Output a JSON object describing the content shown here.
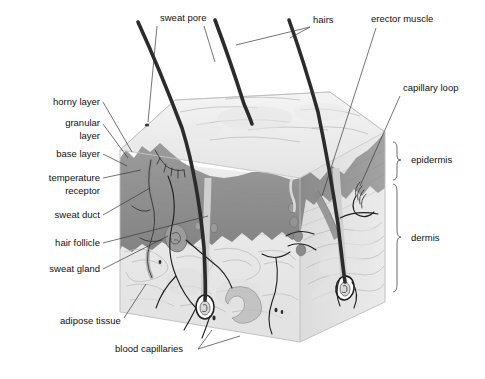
{
  "figure": {
    "background_color": "#ffffff"
  },
  "colors": {
    "epidermis_fill": "#8f8f8f",
    "epidermis_side": "#9a9a9a",
    "dermis_fill": "#e8e8e8",
    "dermis_side": "#dedede",
    "surface_fill": "#efefef",
    "hair_color": "#2b2b2b",
    "vessel_color": "#1f1f1f",
    "label_color": "#111111",
    "leader_color": "#3a3a3a"
  },
  "labels": {
    "left": [
      {
        "id": "horny-layer",
        "text": "horny layer",
        "x": 100,
        "y": 105
      },
      {
        "id": "granular-layer-1",
        "text": "granular",
        "x": 100,
        "y": 126
      },
      {
        "id": "granular-layer-2",
        "text": "layer",
        "x": 100,
        "y": 139
      },
      {
        "id": "base-layer",
        "text": "base layer",
        "x": 100,
        "y": 157
      },
      {
        "id": "temperature-receptor-1",
        "text": "temperature",
        "x": 100,
        "y": 181
      },
      {
        "id": "temperature-receptor-2",
        "text": "receptor",
        "x": 100,
        "y": 194
      },
      {
        "id": "sweat-duct",
        "text": "sweat duct",
        "x": 100,
        "y": 218
      },
      {
        "id": "hair-follicle",
        "text": "hair follicle",
        "x": 100,
        "y": 246
      },
      {
        "id": "sweat-gland",
        "text": "sweat gland",
        "x": 100,
        "y": 272
      }
    ],
    "bottom": [
      {
        "id": "adipose-tissue",
        "text": "adipose tissue",
        "x": 60,
        "y": 324,
        "anchor": "start"
      },
      {
        "id": "blood-capillaries",
        "text": "blood capillaries",
        "x": 115,
        "y": 352,
        "anchor": "start"
      }
    ],
    "top": [
      {
        "id": "sweat-pore",
        "text": "sweat pore",
        "x": 160,
        "y": 21,
        "anchor": "start"
      },
      {
        "id": "hairs",
        "text": "hairs",
        "x": 313,
        "y": 23,
        "anchor": "start"
      },
      {
        "id": "erector-muscle",
        "text": "erector muscle",
        "x": 371,
        "y": 22,
        "anchor": "start"
      }
    ],
    "right": [
      {
        "id": "capillary-loop",
        "text": "capillary loop",
        "x": 403,
        "y": 91,
        "anchor": "start"
      },
      {
        "id": "epidermis",
        "text": "epidermis",
        "x": 411,
        "y": 159,
        "anchor": "start"
      },
      {
        "id": "dermis",
        "text": "dermis",
        "x": 411,
        "y": 237,
        "anchor": "start"
      }
    ]
  },
  "brackets": [
    {
      "id": "epidermis-bracket",
      "label": "epidermis",
      "top": 142,
      "bottom": 180,
      "x": 396
    },
    {
      "id": "dermis-bracket",
      "label": "dermis",
      "top": 184,
      "bottom": 292,
      "x": 396
    }
  ],
  "structures": [
    {
      "id": "hair-shaft-left",
      "name": "hair shaft"
    },
    {
      "id": "hair-shaft-middle",
      "name": "hair shaft"
    },
    {
      "id": "hair-shaft-right",
      "name": "hair shaft"
    },
    {
      "id": "sweat-pore-opening",
      "name": "sweat pore opening"
    },
    {
      "id": "sweat-duct-channel",
      "name": "sweat duct"
    },
    {
      "id": "sweat-gland-coil",
      "name": "sweat gland coil"
    },
    {
      "id": "hair-follicle-bulb-left",
      "name": "hair follicle bulb"
    },
    {
      "id": "hair-follicle-bulb-right",
      "name": "hair follicle bulb"
    },
    {
      "id": "erector-muscle-band",
      "name": "erector pili muscle"
    },
    {
      "id": "capillary-loop-coil",
      "name": "capillary loop"
    },
    {
      "id": "temperature-receptor-body",
      "name": "temperature receptor"
    },
    {
      "id": "adipose-lobule",
      "name": "adipose tissue lobule"
    },
    {
      "id": "blood-capillary-network",
      "name": "blood capillaries"
    }
  ]
}
